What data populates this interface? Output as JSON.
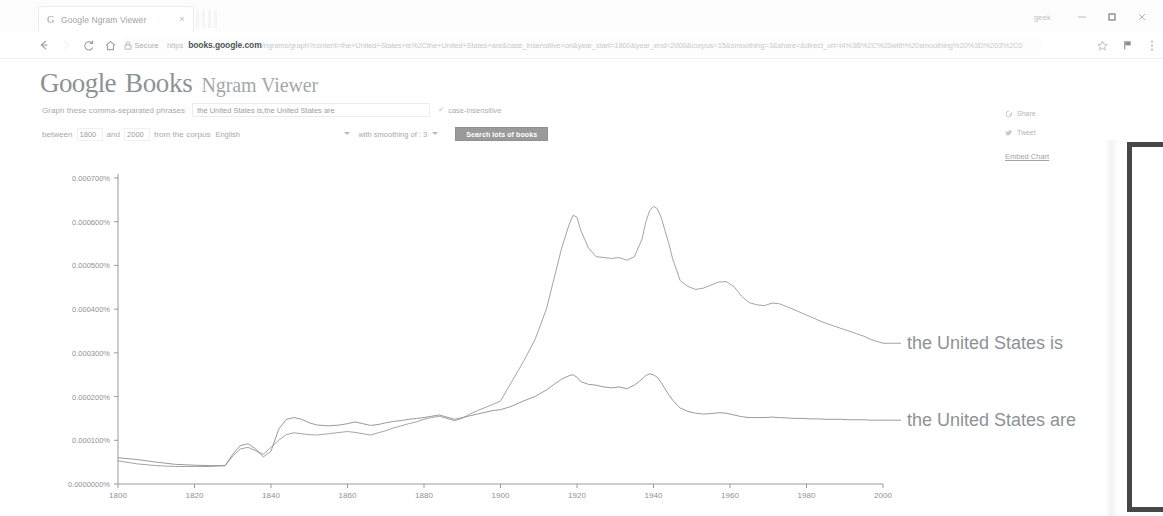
{
  "browser": {
    "tab": {
      "favicon": "google-g-icon",
      "title": "Google Ngram Viewer",
      "close": "×"
    },
    "window": {
      "user_label": "geek",
      "minimize": "–",
      "maximize": "❐",
      "close": "✕"
    },
    "toolbar": {
      "back": "←",
      "forward": "→",
      "reload": "C",
      "home": "⌂",
      "security_icon": "lock-icon",
      "security_text": "Secure",
      "url_scheme": "https",
      "url_host": "books.google.com",
      "url_path": "/ngrams/graph?content=the+United+States+is%2Cthe+United+States+are&case_insensitive=on&year_start=1800&year_end=2000&corpus=15&smoothing=3&share=&direct_url=t4%3B%2C%20with%20smoothing%20%3D%203%2C0",
      "bookmark_icon": "star-icon",
      "flag_icon": "flag-icon",
      "menu_icon": "kebab-menu-icon"
    }
  },
  "app": {
    "logo": {
      "g1": "G",
      "o1": "o",
      "o2": "o",
      "g2": "g",
      "l": "l",
      "e": "e",
      "books": "Books",
      "subtitle": "Ngram Viewer"
    },
    "form": {
      "phrase_label": "Graph these comma-separated phrases",
      "phrase_value": "the United States is,the United States are",
      "phrase_placeholder": "Enter comma-separated phrases",
      "case_insensitive_check": "✓",
      "case_insensitive_label": "case-insensitive",
      "between_label": "between",
      "year_start": "1800",
      "and_label": "and",
      "year_end": "2000",
      "corpus_label": "from the corpus",
      "corpus_value": "English",
      "smoothing_label": "with smoothing of",
      "smoothing_value": "3",
      "search_button": "Search lots of books"
    },
    "share": {
      "share_icon": "google-plus-icon",
      "share_label": "Share",
      "tweet_icon": "twitter-bird-icon",
      "tweet_label": "Tweet",
      "embed_label": "Embed Chart"
    }
  },
  "chart_data": {
    "type": "line",
    "title": "",
    "xlabel": "",
    "ylabel": "",
    "grid": false,
    "legend_position": "right-inline",
    "xlim": [
      1800,
      2000
    ],
    "ylim": [
      0,
      0.0007
    ],
    "xticks": [
      1800,
      1820,
      1840,
      1860,
      1880,
      1900,
      1920,
      1940,
      1960,
      1980,
      2000
    ],
    "xticklabels": [
      "1800",
      "1820",
      "1840",
      "1860",
      "1880",
      "1900",
      "1920",
      "1940",
      "1960",
      "1980",
      "2000"
    ],
    "yticks": [
      0,
      0.0001,
      0.0002,
      0.0003,
      0.0004,
      0.0005,
      0.0006,
      0.0007
    ],
    "yticklabels": [
      "0.0000000%",
      "0.000100%",
      "0.000200%",
      "0.000300%",
      "0.000400%",
      "0.000500%",
      "0.000600%",
      "0.000700%"
    ],
    "series": [
      {
        "name": "the United States is",
        "color": "#9a9a9a",
        "label_color": "#8d9296",
        "x": [
          1800,
          1805,
          1810,
          1815,
          1820,
          1824,
          1828,
          1830,
          1832,
          1834,
          1836,
          1838,
          1840,
          1842,
          1844,
          1846,
          1848,
          1850,
          1852,
          1855,
          1858,
          1860,
          1862,
          1864,
          1866,
          1868,
          1870,
          1872,
          1874,
          1876,
          1878,
          1880,
          1882,
          1884,
          1886,
          1888,
          1890,
          1892,
          1894,
          1896,
          1898,
          1900,
          1903,
          1906,
          1909,
          1912,
          1914,
          1916,
          1918,
          1919,
          1920,
          1921,
          1923,
          1925,
          1927,
          1929,
          1931,
          1933,
          1935,
          1937,
          1938,
          1939,
          1940,
          1941,
          1942,
          1943,
          1944,
          1945,
          1946,
          1947,
          1949,
          1951,
          1953,
          1955,
          1957,
          1959,
          1961,
          1963,
          1965,
          1967,
          1969,
          1971,
          1973,
          1975,
          1977,
          1979,
          1981,
          1983,
          1985,
          1987,
          1989,
          1991,
          1993,
          1995,
          1997,
          2000
        ],
        "y": [
          5.3e-05,
          4.6e-05,
          4.2e-05,
          4e-05,
          4e-05,
          4e-05,
          4.2e-05,
          6.4e-05,
          8e-05,
          8.4e-05,
          7.6e-05,
          6.8e-05,
          8.4e-05,
          0.0001,
          0.000113,
          0.000117,
          0.000115,
          0.000113,
          0.000112,
          0.000115,
          0.000118,
          0.00012,
          0.000118,
          0.000115,
          0.000112,
          0.000117,
          0.000122,
          0.000128,
          0.000133,
          0.000138,
          0.000142,
          0.000148,
          0.000152,
          0.000155,
          0.00015,
          0.000145,
          0.00015,
          0.00016,
          0.000168,
          0.000175,
          0.000182,
          0.00019,
          0.000235,
          0.00028,
          0.00033,
          0.0004,
          0.00047,
          0.00054,
          0.000595,
          0.000615,
          0.00061,
          0.00058,
          0.00054,
          0.00052,
          0.000518,
          0.000516,
          0.000518,
          0.000512,
          0.00052,
          0.00056,
          0.0006,
          0.000625,
          0.000635,
          0.00063,
          0.00061,
          0.00058,
          0.00055,
          0.000515,
          0.00049,
          0.000465,
          0.000452,
          0.000445,
          0.000448,
          0.000455,
          0.000462,
          0.000463,
          0.000452,
          0.00043,
          0.000415,
          0.00041,
          0.000408,
          0.000414,
          0.000412,
          0.000405,
          0.000398,
          0.00039,
          0.000383,
          0.000375,
          0.000368,
          0.000362,
          0.000356,
          0.00035,
          0.000344,
          0.000338,
          0.00033,
          0.000322
        ]
      },
      {
        "name": "the United States are",
        "color": "#8e8e8e",
        "label_color": "#8d9296",
        "x": [
          1800,
          1805,
          1810,
          1815,
          1820,
          1824,
          1828,
          1830,
          1832,
          1834,
          1836,
          1838,
          1840,
          1842,
          1844,
          1846,
          1848,
          1850,
          1852,
          1855,
          1858,
          1860,
          1862,
          1864,
          1866,
          1868,
          1870,
          1872,
          1874,
          1876,
          1878,
          1880,
          1882,
          1884,
          1886,
          1888,
          1890,
          1892,
          1894,
          1896,
          1898,
          1900,
          1903,
          1906,
          1909,
          1912,
          1914,
          1916,
          1918,
          1919,
          1920,
          1921,
          1923,
          1925,
          1927,
          1929,
          1931,
          1933,
          1935,
          1937,
          1938,
          1939,
          1940,
          1941,
          1942,
          1943,
          1944,
          1945,
          1946,
          1947,
          1949,
          1951,
          1953,
          1955,
          1957,
          1959,
          1961,
          1963,
          1965,
          1967,
          1969,
          1971,
          1973,
          1975,
          1977,
          1979,
          1981,
          1983,
          1985,
          1987,
          1989,
          1991,
          1993,
          1995,
          1997,
          2000
        ],
        "y": [
          6e-05,
          5.6e-05,
          5e-05,
          4.5e-05,
          4.3e-05,
          4.2e-05,
          4.2e-05,
          6.8e-05,
          8.8e-05,
          9.2e-05,
          8e-05,
          6.2e-05,
          7.5e-05,
          0.000125,
          0.000148,
          0.000152,
          0.000148,
          0.00014,
          0.000135,
          0.000133,
          0.000135,
          0.000138,
          0.000142,
          0.000138,
          0.000134,
          0.000136,
          0.00014,
          0.000143,
          0.000145,
          0.000148,
          0.00015,
          0.000152,
          0.000155,
          0.000158,
          0.000153,
          0.000148,
          0.000152,
          0.000156,
          0.00016,
          0.000164,
          0.000168,
          0.00017,
          0.000178,
          0.00019,
          0.0002,
          0.000215,
          0.000228,
          0.00024,
          0.000248,
          0.00025,
          0.000244,
          0.000234,
          0.000228,
          0.000226,
          0.000222,
          0.00022,
          0.000222,
          0.000218,
          0.000226,
          0.00024,
          0.000248,
          0.000252,
          0.00025,
          0.000244,
          0.000232,
          0.000218,
          0.000204,
          0.000192,
          0.000182,
          0.000174,
          0.000166,
          0.000162,
          0.00016,
          0.000161,
          0.000163,
          0.000162,
          0.000158,
          0.000154,
          0.000152,
          0.000152,
          0.000152,
          0.000153,
          0.000152,
          0.000151,
          0.00015,
          0.00015,
          0.000149,
          0.000149,
          0.000148,
          0.000148,
          0.000148,
          0.000147,
          0.000147,
          0.000147,
          0.000146,
          0.000146
        ]
      }
    ]
  }
}
